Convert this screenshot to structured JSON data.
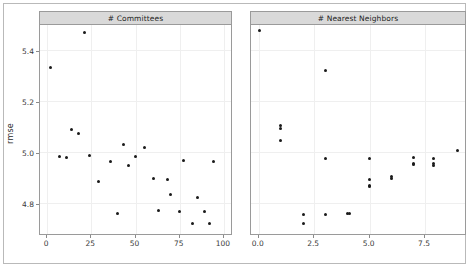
{
  "chart_data": {
    "type": "scatter",
    "title": "",
    "xlabel": "",
    "ylabel": "rmse",
    "ylim": [
      4.68,
      5.5
    ],
    "grid": true,
    "legend": null,
    "layout": "1 row x 2 columns, facetted (lattice/trellis) scatter panels sharing the rmse y-axis",
    "y_ticks": [
      5.4,
      5.2,
      5.0,
      4.8
    ],
    "y_tick_labels": [
      "5.4",
      "5.2",
      "5.0",
      "4.8"
    ],
    "panels": [
      {
        "strip_label": "# Committees",
        "xlabel": "# Committees",
        "xlim": [
          -4,
          104
        ],
        "x_ticks": [
          0,
          25,
          50,
          75,
          100
        ],
        "x_tick_labels": [
          "0",
          "25",
          "50",
          "75",
          "100"
        ],
        "points": [
          {
            "x": 2,
            "y": 5.335
          },
          {
            "x": 7,
            "y": 4.985
          },
          {
            "x": 11,
            "y": 4.98
          },
          {
            "x": 14,
            "y": 5.09
          },
          {
            "x": 18,
            "y": 5.075
          },
          {
            "x": 21,
            "y": 5.47
          },
          {
            "x": 24,
            "y": 4.988
          },
          {
            "x": 29,
            "y": 4.885
          },
          {
            "x": 36,
            "y": 4.965
          },
          {
            "x": 40,
            "y": 4.76
          },
          {
            "x": 43,
            "y": 5.03
          },
          {
            "x": 46,
            "y": 4.95
          },
          {
            "x": 50,
            "y": 4.983
          },
          {
            "x": 55,
            "y": 5.02
          },
          {
            "x": 60,
            "y": 4.897
          },
          {
            "x": 63,
            "y": 4.773
          },
          {
            "x": 68,
            "y": 4.892
          },
          {
            "x": 70,
            "y": 4.835
          },
          {
            "x": 75,
            "y": 4.77
          },
          {
            "x": 77,
            "y": 4.968
          },
          {
            "x": 82,
            "y": 4.722
          },
          {
            "x": 85,
            "y": 4.822
          },
          {
            "x": 89,
            "y": 4.77
          },
          {
            "x": 92,
            "y": 4.72
          },
          {
            "x": 94,
            "y": 4.963
          }
        ]
      },
      {
        "strip_label": "# Nearest Neighbors",
        "xlabel": "# Nearest Neighbors",
        "xlim": [
          -0.35,
          9.3
        ],
        "x_ticks": [
          0.0,
          2.5,
          5.0,
          7.5
        ],
        "x_tick_labels": [
          "0.0",
          "2.5",
          "5.0",
          "7.5"
        ],
        "points": [
          {
            "x": 0.05,
            "y": 5.48
          },
          {
            "x": 1.0,
            "y": 5.105
          },
          {
            "x": 1.0,
            "y": 5.092
          },
          {
            "x": 1.0,
            "y": 5.048
          },
          {
            "x": 2.0,
            "y": 4.756
          },
          {
            "x": 2.0,
            "y": 4.722
          },
          {
            "x": 3.0,
            "y": 5.32
          },
          {
            "x": 3.0,
            "y": 4.975
          },
          {
            "x": 3.0,
            "y": 4.758
          },
          {
            "x": 4.0,
            "y": 4.762
          },
          {
            "x": 4.1,
            "y": 4.762
          },
          {
            "x": 5.0,
            "y": 4.975
          },
          {
            "x": 5.0,
            "y": 4.893
          },
          {
            "x": 5.0,
            "y": 4.872
          },
          {
            "x": 5.0,
            "y": 4.866
          },
          {
            "x": 6.0,
            "y": 4.905
          },
          {
            "x": 6.0,
            "y": 4.897
          },
          {
            "x": 7.0,
            "y": 4.982
          },
          {
            "x": 7.0,
            "y": 4.958
          },
          {
            "x": 7.0,
            "y": 4.951
          },
          {
            "x": 7.9,
            "y": 4.978
          },
          {
            "x": 7.9,
            "y": 4.955
          },
          {
            "x": 7.9,
            "y": 4.948
          },
          {
            "x": 8.95,
            "y": 5.008
          }
        ]
      }
    ]
  }
}
